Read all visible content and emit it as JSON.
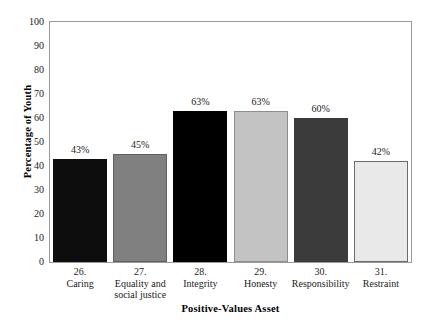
{
  "chart_data": {
    "type": "bar",
    "title": "",
    "xlabel": "Positive-Values Asset",
    "ylabel": "Percentage of Youth",
    "ylim": [
      0,
      100
    ],
    "yticks": [
      0,
      10,
      20,
      30,
      40,
      50,
      60,
      70,
      80,
      90,
      100
    ],
    "ytick_labels": [
      "0",
      "10",
      "20",
      "30",
      "40",
      "50",
      "60",
      "70",
      "80",
      "90",
      "100"
    ],
    "grid": false,
    "legend": "none",
    "categories": [
      "26. Caring",
      "27. Equality and social justice",
      "28. Integrity",
      "29. Honesty",
      "30. Responsibility",
      "31. Restraint"
    ],
    "values": [
      43,
      45,
      63,
      63,
      60,
      42
    ],
    "value_labels": [
      "43%",
      "45%",
      "63%",
      "63%",
      "60%",
      "42%"
    ],
    "bars": [
      {
        "number": "26.",
        "name": "Caring",
        "value": 43,
        "value_label": "43%",
        "fill": "#0d0d0d",
        "stroke": "#0d0d0d"
      },
      {
        "number": "27.",
        "name": "Equality and social justice",
        "name_line1": "Equality and",
        "name_line2": "social justice",
        "value": 45,
        "value_label": "45%",
        "fill": "#808080",
        "stroke": "#5e5e5e"
      },
      {
        "number": "28.",
        "name": "Integrity",
        "value": 63,
        "value_label": "63%",
        "fill": "#000000",
        "stroke": "#000000"
      },
      {
        "number": "29.",
        "name": "Honesty",
        "value": 63,
        "value_label": "63%",
        "fill": "#c3c3c3",
        "stroke": "#8d8d8d"
      },
      {
        "number": "30.",
        "name": "Responsibility",
        "value": 60,
        "value_label": "60%",
        "fill": "#3b3b3b",
        "stroke": "#3b3b3b"
      },
      {
        "number": "31.",
        "name": "Restraint",
        "value": 42,
        "value_label": "42%",
        "fill": "#e9e9e9",
        "stroke": "#6b6b6b"
      }
    ],
    "colors": {
      "plot_border": "#9a9a9a",
      "background": "#ffffff",
      "text": "#1a1a1a"
    }
  }
}
